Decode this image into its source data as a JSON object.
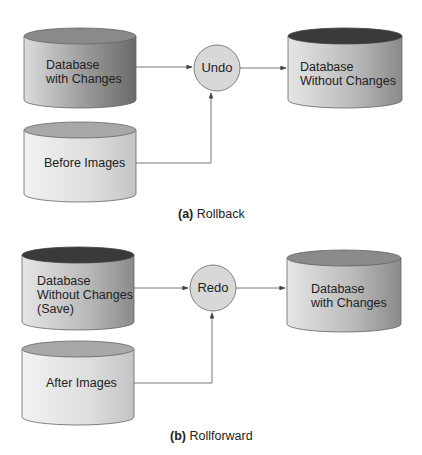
{
  "rollback": {
    "caption_prefix": "(a)",
    "caption_text": "Rollback",
    "source_db": [
      "Database",
      "with Changes"
    ],
    "images_db": "Before Images",
    "process": "Undo",
    "result_db": [
      "Database",
      "Without Changes"
    ]
  },
  "rollforward": {
    "caption_prefix": "(b)",
    "caption_text": "Rollforward",
    "source_db": [
      "Database",
      "Without Changes",
      "(Save)"
    ],
    "images_db": "After Images",
    "process": "Redo",
    "result_db": [
      "Database",
      "with Changes"
    ]
  },
  "colors": {
    "cylinder_dark_top": "#3a3a3a",
    "cylinder_mid_top": "#8a8a8a",
    "cylinder_light_top": "#b0b0b0",
    "circle_fill": "#d8d8d8",
    "line": "#555555"
  }
}
